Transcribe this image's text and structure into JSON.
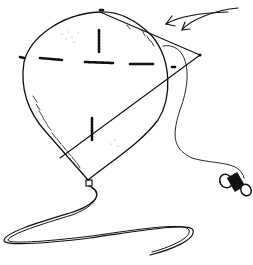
{
  "figure": {
    "type": "line-drawing",
    "colors": {
      "ink": "#111111",
      "background": "#ffffff"
    },
    "elements": [
      "balloon-envelope",
      "balloon-seams",
      "balloon-tether-line",
      "balloon-neck",
      "ribbon-string",
      "cord-to-spool",
      "spool",
      "curved-arrows"
    ]
  }
}
